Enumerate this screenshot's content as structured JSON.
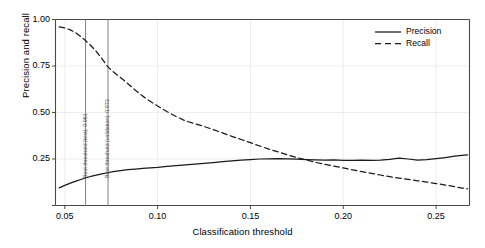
{
  "chart_data": {
    "type": "line",
    "title": "",
    "xlabel": "Classification threshold",
    "ylabel": "Precision and recall",
    "xlim": [
      0.045,
      0.268
    ],
    "ylim": [
      0.0,
      1.0
    ],
    "xticks": [
      0.05,
      0.1,
      0.15,
      0.2,
      0.25
    ],
    "xtick_labels": [
      "0.05",
      "0.10",
      "0.15",
      "0.20",
      "0.25"
    ],
    "yticks": [
      0.0,
      0.25,
      0.5,
      0.75,
      1.0
    ],
    "ytick_labels": [
      "0.00",
      "0.25",
      "0.50",
      "0.75",
      "1.00"
    ],
    "grid": true,
    "legend_position": "upper right",
    "series": [
      {
        "name": "Precision",
        "style": "solid",
        "color": "#1a1a1a",
        "x": [
          0.047,
          0.05,
          0.053,
          0.056,
          0.059,
          0.061,
          0.064,
          0.067,
          0.07,
          0.073,
          0.076,
          0.08,
          0.084,
          0.088,
          0.092,
          0.096,
          0.1,
          0.105,
          0.11,
          0.115,
          0.12,
          0.125,
          0.13,
          0.135,
          0.14,
          0.145,
          0.15,
          0.155,
          0.16,
          0.165,
          0.17,
          0.175,
          0.18,
          0.185,
          0.19,
          0.195,
          0.2,
          0.205,
          0.21,
          0.215,
          0.22,
          0.225,
          0.23,
          0.235,
          0.24,
          0.245,
          0.25,
          0.255,
          0.26,
          0.264,
          0.267
        ],
        "y": [
          0.095,
          0.108,
          0.12,
          0.131,
          0.141,
          0.148,
          0.156,
          0.163,
          0.17,
          0.176,
          0.182,
          0.188,
          0.193,
          0.196,
          0.199,
          0.202,
          0.205,
          0.21,
          0.214,
          0.218,
          0.222,
          0.226,
          0.231,
          0.236,
          0.24,
          0.244,
          0.247,
          0.25,
          0.251,
          0.252,
          0.251,
          0.249,
          0.247,
          0.245,
          0.244,
          0.245,
          0.243,
          0.242,
          0.244,
          0.243,
          0.244,
          0.248,
          0.255,
          0.25,
          0.244,
          0.247,
          0.252,
          0.258,
          0.265,
          0.27,
          0.272
        ]
      },
      {
        "name": "Recall",
        "style": "dashed",
        "color": "#1a1a1a",
        "x": [
          0.047,
          0.05,
          0.053,
          0.056,
          0.059,
          0.061,
          0.064,
          0.067,
          0.07,
          0.073,
          0.076,
          0.08,
          0.084,
          0.088,
          0.092,
          0.096,
          0.1,
          0.105,
          0.11,
          0.115,
          0.12,
          0.125,
          0.13,
          0.135,
          0.14,
          0.145,
          0.15,
          0.155,
          0.16,
          0.165,
          0.17,
          0.175,
          0.18,
          0.185,
          0.19,
          0.195,
          0.2,
          0.205,
          0.21,
          0.215,
          0.22,
          0.225,
          0.23,
          0.235,
          0.24,
          0.245,
          0.25,
          0.255,
          0.26,
          0.264,
          0.267
        ],
        "y": [
          0.96,
          0.955,
          0.944,
          0.928,
          0.905,
          0.888,
          0.86,
          0.828,
          0.79,
          0.748,
          0.72,
          0.688,
          0.655,
          0.62,
          0.588,
          0.56,
          0.535,
          0.505,
          0.478,
          0.455,
          0.44,
          0.425,
          0.408,
          0.39,
          0.372,
          0.355,
          0.338,
          0.32,
          0.303,
          0.288,
          0.272,
          0.258,
          0.245,
          0.232,
          0.222,
          0.212,
          0.202,
          0.192,
          0.182,
          0.173,
          0.164,
          0.155,
          0.147,
          0.14,
          0.133,
          0.126,
          0.118,
          0.11,
          0.101,
          0.094,
          0.09
        ]
      }
    ],
    "vertical_lines": [
      {
        "name": "best-threshold-test",
        "x": 0.0612,
        "label": "Best threshold (test): 0.061",
        "color": "#808080"
      },
      {
        "name": "best-threshold-validation",
        "x": 0.0733,
        "label": "Best threshold (validation): 0.073",
        "color": "#808080"
      }
    ]
  },
  "legend": {
    "items": [
      {
        "label": "Precision",
        "style": "solid"
      },
      {
        "label": "Recall",
        "style": "dashed"
      }
    ]
  }
}
